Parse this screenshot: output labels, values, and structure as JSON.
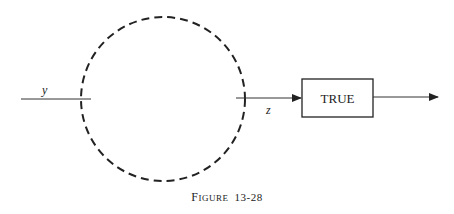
{
  "diagram": {
    "input_label": "y",
    "output_label": "z",
    "block_label": "TRUE",
    "caption_first": "F",
    "caption_rest": "IGURE",
    "caption_number": "13-28",
    "colors": {
      "ink": "#222222",
      "background": "#ffffff"
    }
  }
}
